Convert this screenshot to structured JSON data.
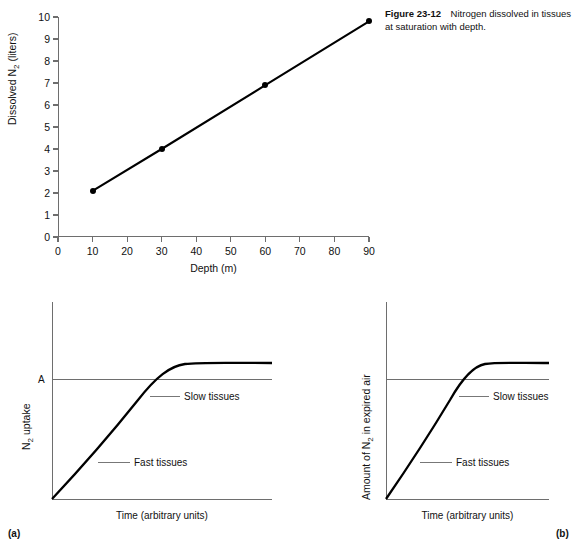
{
  "caption": {
    "label": "Figure 23-12",
    "text": "Nitrogen dissolved in tissues at saturation with depth."
  },
  "chart_data": [
    {
      "id": "nitrogen-vs-depth",
      "type": "line",
      "title": "Nitrogen dissolved in tissues at saturation with depth",
      "xlabel": "Depth (m)",
      "ylabel": "Dissolved N2 (liters)",
      "ylabel_parts": {
        "pre": "Dissolved N",
        "sub": "2",
        "post": " (liters)"
      },
      "x": [
        10,
        30,
        60,
        90
      ],
      "values": [
        2.1,
        4.0,
        6.9,
        9.8
      ],
      "xticks": [
        0,
        10,
        20,
        30,
        40,
        50,
        60,
        70,
        80,
        90
      ],
      "yticks": [
        0,
        1,
        2,
        3,
        4,
        5,
        6,
        7,
        8,
        9,
        10
      ],
      "xlim": [
        0,
        90
      ],
      "ylim": [
        0,
        10
      ],
      "grid": false,
      "markers": "filled-circle",
      "legend": null
    },
    {
      "id": "n2-uptake-panel-a",
      "type": "line",
      "panel": "(a)",
      "xlabel": "Time (arbitrary units)",
      "ylabel": "N2 uptake",
      "ylabel_parts": {
        "pre": "N",
        "sub": "2",
        "post": " uptake"
      },
      "asymptote_label": "A",
      "annotations": [
        "Slow tissues",
        "Fast tissues"
      ],
      "xticks": [],
      "yticks": [],
      "grid": false,
      "legend": null
    },
    {
      "id": "n2-expired-panel-b",
      "type": "line",
      "panel": "(b)",
      "xlabel": "Time (arbitrary units)",
      "ylabel": "Amount of N2 in expired air",
      "ylabel_parts": {
        "pre": "Amount of N",
        "sub": "2",
        "post": " in expired air"
      },
      "asymptote_label": "",
      "annotations": [
        "Slow tissues",
        "Fast tissues"
      ],
      "xticks": [],
      "yticks": [],
      "grid": false,
      "legend": null
    }
  ],
  "top_chart": {
    "xlabel": "Depth (m)",
    "ylabel_pre": "Dissolved N",
    "ylabel_sub": "2",
    "ylabel_post": " (liters)",
    "xticks": [
      "0",
      "10",
      "20",
      "30",
      "40",
      "50",
      "60",
      "70",
      "80",
      "90"
    ],
    "yticks": [
      "0",
      "1",
      "2",
      "3",
      "4",
      "5",
      "6",
      "7",
      "8",
      "9",
      "10"
    ]
  },
  "panel_a": {
    "tag": "(a)",
    "ylabel_pre": "N",
    "ylabel_sub": "2",
    "ylabel_post": " uptake",
    "xlabel": "Time (arbitrary units)",
    "asymptote": "A",
    "slow_label": "Slow tissues",
    "fast_label": "Fast tissues"
  },
  "panel_b": {
    "tag": "(b)",
    "ylabel_pre": "Amount of N",
    "ylabel_sub": "2",
    "ylabel_post": " in expired air",
    "xlabel": "Time (arbitrary units)",
    "asymptote": "",
    "slow_label": "Slow tissues",
    "fast_label": "Fast tissues"
  },
  "colors": {
    "curve": "#000000",
    "axis": "#6e6e6e",
    "leader": "#777777",
    "text": "#111111",
    "background": "#ffffff"
  }
}
